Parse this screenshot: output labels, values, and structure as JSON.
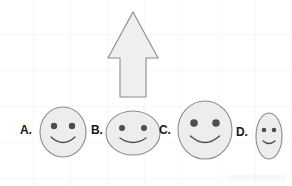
{
  "scene": {
    "title": "Smiley faces size comparison with upward arrow",
    "background": "#ffffff",
    "grid_color": "#f2f2f6",
    "width": 292,
    "height": 186
  },
  "arrow": {
    "name": "up-arrow",
    "direction": "up",
    "fill": "#efefef",
    "stroke": "#8c8c8c",
    "tip_x": 133,
    "tip_y": 12,
    "head_left_x": 108,
    "head_right_x": 158,
    "head_base_y": 58,
    "shaft_left_x": 120,
    "shaft_right_x": 146,
    "shaft_bottom_y": 97
  },
  "labels": [
    {
      "id": "A",
      "text": "A.",
      "x": 20,
      "y": 124
    },
    {
      "id": "B",
      "text": "B.",
      "x": 91,
      "y": 124
    },
    {
      "id": "C",
      "text": "C.",
      "x": 159,
      "y": 124
    },
    {
      "id": "D",
      "text": "D.",
      "x": 236,
      "y": 126
    }
  ],
  "faces": [
    {
      "id": "A",
      "shape": "circle",
      "cx": 63,
      "cy": 132,
      "rx": 23,
      "ry": 25,
      "fill": "#ededed",
      "stroke": "#8c8c8c",
      "eye_r": 3.2,
      "eye_offset_x": 9,
      "eye_offset_y": -6,
      "eye_fill": "#4d4d4d",
      "mouth_width": 24,
      "mouth_depth": 11,
      "mouth_y": 137
    },
    {
      "id": "B",
      "shape": "ellipse-wide",
      "cx": 133,
      "cy": 133,
      "rx": 27,
      "ry": 22,
      "fill": "#ededed",
      "stroke": "#8c8c8c",
      "eye_r": 3.0,
      "eye_offset_x": 11,
      "eye_offset_y": -5,
      "eye_fill": "#4d4d4d",
      "mouth_width": 26,
      "mouth_depth": 9,
      "mouth_y": 138
    },
    {
      "id": "C",
      "shape": "circle",
      "cx": 205,
      "cy": 130,
      "rx": 27,
      "ry": 29,
      "fill": "#ededed",
      "stroke": "#8c8c8c",
      "eye_r": 3.8,
      "eye_offset_x": 11,
      "eye_offset_y": -7,
      "eye_fill": "#4d4d4d",
      "mouth_width": 29,
      "mouth_depth": 13,
      "mouth_y": 136
    },
    {
      "id": "D",
      "shape": "ellipse-tall",
      "cx": 269,
      "cy": 136,
      "rx": 13,
      "ry": 23,
      "fill": "#ededed",
      "stroke": "#8c8c8c",
      "eye_r": 2.3,
      "eye_offset_x": 5,
      "eye_offset_y": -6,
      "eye_fill": "#4d4d4d",
      "mouth_width": 12,
      "mouth_depth": 5,
      "mouth_y": 141
    }
  ]
}
